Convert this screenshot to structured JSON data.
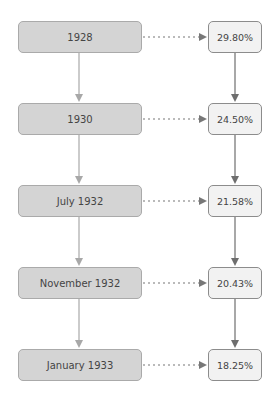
{
  "diagram": {
    "type": "flow",
    "years": [
      {
        "label": "1928"
      },
      {
        "label": "1930"
      },
      {
        "label": "July 1932"
      },
      {
        "label": "November 1932"
      },
      {
        "label": "January 1933"
      }
    ],
    "values": [
      {
        "label": "29.80%"
      },
      {
        "label": "24.50%"
      },
      {
        "label": "21.58%"
      },
      {
        "label": "20.43%"
      },
      {
        "label": "18.25%"
      }
    ],
    "colors": {
      "left_fill": "#d4d4d4",
      "right_fill": "#f2f2f2",
      "solid_arrow_left": "#a8a8a8",
      "solid_arrow_right": "#6e6e6e",
      "dotted_arrow": "#777777"
    }
  }
}
